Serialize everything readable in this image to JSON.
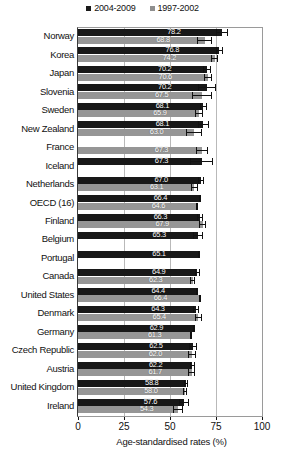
{
  "chart_data": {
    "type": "bar",
    "orientation": "horizontal",
    "title": "",
    "xlabel": "Age-standardised rates (%)",
    "ylabel": "",
    "xlim": [
      0,
      100
    ],
    "xticks": [
      0,
      25,
      50,
      75,
      100
    ],
    "grid": true,
    "legend_position": "top-center",
    "categories": [
      "Norway",
      "Korea",
      "Japan",
      "Slovenia",
      "Sweden",
      "New Zealand",
      "France",
      "Iceland",
      "Netherlands",
      "OECD (16)",
      "Finland",
      "Belgium",
      "Portugal",
      "Canada",
      "United States",
      "Denmark",
      "Germany",
      "Czech Republic",
      "Austria",
      "United Kingdom",
      "Ireland"
    ],
    "series": [
      {
        "name": "2004-2009",
        "color": "#181818",
        "values": [
          78.2,
          76.8,
          70.2,
          70.2,
          68.1,
          68.1,
          null,
          67.3,
          67.0,
          66.4,
          66.3,
          65.3,
          65.1,
          64.9,
          64.4,
          64.3,
          62.9,
          62.5,
          62.2,
          58.8,
          57.6
        ],
        "err_low": [
          75.0,
          74.9,
          68.2,
          65.3,
          66.1,
          65.2,
          null,
          61.0,
          65.3,
          65.8,
          64.6,
          62.6,
          65.1,
          63.6,
          64.1,
          62.6,
          62.3,
          60.4,
          60.6,
          57.8,
          55.0
        ],
        "err_high": [
          81.4,
          78.7,
          72.2,
          75.1,
          70.1,
          71.0,
          null,
          73.6,
          68.7,
          67.0,
          68.0,
          68.0,
          65.1,
          66.2,
          64.7,
          66.0,
          63.5,
          64.6,
          63.8,
          59.8,
          60.2
        ]
      },
      {
        "name": "1997-2002",
        "color": "#969696",
        "values": [
          68.8,
          74.2,
          70.6,
          67.5,
          65.9,
          63.0,
          67.3,
          null,
          63.1,
          64.6,
          67.9,
          null,
          null,
          62.3,
          66.4,
          65.4,
          61.3,
          62.0,
          61.7,
          58.0,
          54.3
        ],
        "err_low": [
          64.8,
          72.1,
          68.6,
          62.0,
          63.6,
          58.8,
          64.0,
          null,
          61.2,
          64.0,
          66.0,
          null,
          null,
          60.9,
          66.0,
          63.6,
          60.7,
          59.8,
          60.0,
          56.9,
          51.4
        ],
        "err_high": [
          72.8,
          76.3,
          72.6,
          73.0,
          68.2,
          67.2,
          70.6,
          null,
          65.0,
          65.2,
          69.8,
          null,
          null,
          63.7,
          66.8,
          67.2,
          61.9,
          64.2,
          63.4,
          59.1,
          57.2
        ]
      }
    ],
    "value_labels": {
      "Norway": [
        "78.2",
        "68.8"
      ],
      "Korea": [
        "76.8",
        "74.2"
      ],
      "Japan": [
        "70.2",
        "70.6"
      ],
      "Slovenia": [
        "70.2",
        "67.5"
      ],
      "Sweden": [
        "68.1",
        "65.9"
      ],
      "New Zealand": [
        "68.1",
        "63.0"
      ],
      "France": [
        "",
        "67.3"
      ],
      "Iceland": [
        "67.3",
        ""
      ],
      "Netherlands": [
        "67.0",
        "63.1"
      ],
      "OECD (16)": [
        "66.4",
        "64.6"
      ],
      "Finland": [
        "66.3",
        "67.9"
      ],
      "Belgium": [
        "65.3",
        ""
      ],
      "Portugal": [
        "65.1",
        ""
      ],
      "Canada": [
        "64.9",
        "62.3"
      ],
      "United States": [
        "64.4",
        "66.4"
      ],
      "Denmark": [
        "64.3",
        "65.4"
      ],
      "Germany": [
        "62.9",
        "61.3"
      ],
      "Czech Republic": [
        "62.5",
        "62.0"
      ],
      "Austria": [
        "62.2",
        "61.7"
      ],
      "United Kingdom": [
        "58.8",
        "58.0"
      ],
      "Ireland": [
        "57.6",
        "54.3"
      ]
    }
  },
  "legend": {
    "entries": [
      {
        "label": "2004-2009",
        "color": "#181818"
      },
      {
        "label": "1997-2002",
        "color": "#969696"
      }
    ]
  },
  "axis": {
    "x_title": "Age-standardised rates (%)",
    "x_tick_labels": [
      "0",
      "25",
      "50",
      "75",
      "100"
    ]
  }
}
